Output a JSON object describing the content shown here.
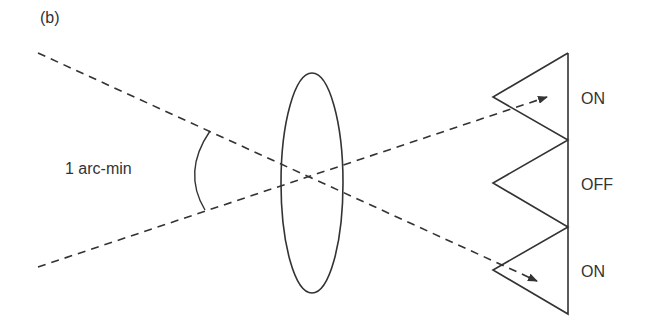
{
  "figure": {
    "panel_label": "(b)",
    "angle_label": "1 arc-min",
    "states": [
      {
        "label": "ON"
      },
      {
        "label": "OFF"
      },
      {
        "label": "ON"
      }
    ],
    "colors": {
      "stroke": "#333333",
      "background": "#ffffff"
    }
  }
}
